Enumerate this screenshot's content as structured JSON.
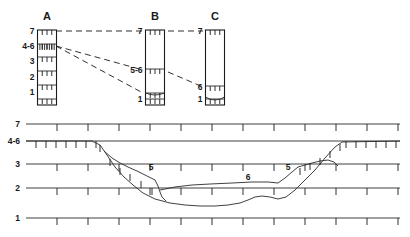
{
  "figure": {
    "background_color": "#ffffff",
    "line_color": "#1a1a1a"
  },
  "columns": {
    "headers": [
      {
        "id": "A",
        "label": "A"
      },
      {
        "id": "B",
        "label": "B"
      },
      {
        "id": "C",
        "label": "C"
      }
    ],
    "A": {
      "label": "A",
      "bed_labels": [
        "7",
        "4-6",
        "3",
        "2",
        "1"
      ]
    },
    "B": {
      "label": "B",
      "bed_labels": [
        "7",
        "5-6",
        "1"
      ]
    },
    "C": {
      "label": "C",
      "bed_labels": [
        "7",
        "6",
        "1"
      ]
    }
  },
  "correlation_lines": [
    {
      "name": "unit-7-correlation",
      "from": "A",
      "to": "C",
      "unit": "7"
    },
    {
      "name": "unit-5-6-correlation",
      "from": "A",
      "to": "B",
      "unit": "5-6"
    },
    {
      "name": "unit-6-correlation",
      "from": "A",
      "to": "C",
      "unit": "6"
    }
  ],
  "cross_section": {
    "axis_labels": [
      "7",
      "4-6",
      "3",
      "2",
      "1"
    ],
    "annotations": [
      {
        "name": "left-unit-5",
        "label": "5"
      },
      {
        "name": "valley-unit-6",
        "label": "6"
      },
      {
        "name": "right-unit-5",
        "label": "5"
      }
    ]
  },
  "chart_data": {
    "type": "line",
    "xlabel": "",
    "ylabel": "Stratigraphic unit",
    "grid": true,
    "legend_position": "none",
    "panels": [
      {
        "name": "correlation-panel",
        "type": "columns",
        "columns": [
          {
            "name": "A",
            "x_center": 47,
            "top_y": 30,
            "bottom_y": 105,
            "bed_boundaries_y": [
              30,
              44,
              57,
              71,
              85,
              99
            ],
            "bed_labels": [
              {
                "label": "7",
                "y": 31
              },
              {
                "label": "4-6",
                "y": 46
              },
              {
                "label": "3",
                "y": 61
              },
              {
                "label": "2",
                "y": 77
              },
              {
                "label": "1",
                "y": 92
              }
            ]
          },
          {
            "name": "B",
            "x_center": 155,
            "top_y": 30,
            "bottom_y": 105,
            "bed_boundaries_y": [
              30,
              69,
              93,
              99
            ],
            "bed_labels": [
              {
                "label": "7",
                "y": 31
              },
              {
                "label": "5-6",
                "y": 70
              },
              {
                "label": "1",
                "y": 99
              }
            ]
          },
          {
            "name": "C",
            "x_center": 215,
            "top_y": 30,
            "bottom_y": 105,
            "bed_boundaries_y": [
              30,
              86,
              99
            ],
            "bed_labels": [
              {
                "label": "7",
                "y": 31
              },
              {
                "label": "6",
                "y": 87
              },
              {
                "label": "1",
                "y": 99
              }
            ]
          }
        ],
        "correlations": [
          {
            "unit": "7",
            "points": [
              [
                56,
                31
              ],
              [
                143,
                31
              ]
            ]
          },
          {
            "unit": "7b",
            "points": [
              [
                168,
                31
              ],
              [
                203,
                31
              ]
            ]
          },
          {
            "unit": "5-6",
            "points": [
              [
                56,
                46
              ],
              [
                143,
                70
              ]
            ]
          },
          {
            "unit": "6a",
            "points": [
              [
                56,
                46
              ],
              [
                143,
                93
              ]
            ]
          },
          {
            "unit": "6b",
            "points": [
              [
                168,
                72
              ],
              [
                203,
                87
              ]
            ]
          }
        ]
      },
      {
        "name": "cross-section-panel",
        "type": "profile",
        "datum_lines": [
          {
            "unit": "7",
            "y": 124,
            "x_start": 26,
            "x_end": 400,
            "tick_spacing": 31,
            "tick_len": 7
          },
          {
            "unit": "4-6",
            "y": 141,
            "x_start": 26,
            "x_end": 400,
            "tick_spacing": 10,
            "tick_len": 7
          },
          {
            "unit": "3",
            "y": 164,
            "x_start": 26,
            "x_end": 400,
            "tick_spacing": 31,
            "tick_len": 7
          },
          {
            "unit": "2",
            "y": 188,
            "x_start": 26,
            "x_end": 400,
            "tick_spacing": 31,
            "tick_len": 7
          },
          {
            "unit": "1",
            "y": 218,
            "x_start": 26,
            "x_end": 400,
            "tick_spacing": 31,
            "tick_len": 7
          }
        ],
        "profiles": [
          {
            "name": "upper-erosion-surface",
            "points": [
              [
                26,
                141
              ],
              [
                92,
                141
              ],
              [
                100,
                145
              ],
              [
                107,
                155
              ],
              [
                115,
                167
              ],
              [
                124,
                177
              ],
              [
                133,
                185
              ],
              [
                143,
                193
              ],
              [
                155,
                199
              ],
              [
                170,
                203
              ],
              [
                185,
                205
              ],
              [
                200,
                206
              ],
              [
                215,
                206
              ],
              [
                228,
                205
              ],
              [
                240,
                203
              ],
              [
                248,
                200
              ],
              [
                255,
                197
              ],
              [
                262,
                196
              ],
              [
                270,
                197
              ],
              [
                278,
                199
              ],
              [
                286,
                197
              ],
              [
                295,
                190
              ],
              [
                305,
                180
              ],
              [
                315,
                170
              ],
              [
                325,
                158
              ],
              [
                335,
                147
              ],
              [
                342,
                142
              ],
              [
                400,
                141
              ]
            ]
          },
          {
            "name": "unit-5-left-bench",
            "points": [
              [
                104,
                151
              ],
              [
                112,
                158
              ],
              [
                120,
                163
              ],
              [
                128,
                167
              ],
              [
                137,
                171
              ],
              [
                147,
                176
              ],
              [
                155,
                180
              ],
              [
                158,
                186
              ],
              [
                160,
                192
              ],
              [
                162,
                197
              ],
              [
                166,
                201
              ]
            ]
          },
          {
            "name": "unit-6-valley-fill",
            "points": [
              [
                160,
                190
              ],
              [
                175,
                187
              ],
              [
                192,
                185
              ],
              [
                210,
                184
              ],
              [
                232,
                183
              ],
              [
                252,
                182
              ],
              [
                268,
                182
              ],
              [
                278,
                183
              ]
            ]
          },
          {
            "name": "unit-5-right-bench",
            "points": [
              [
                278,
                183
              ],
              [
                285,
                178
              ],
              [
                292,
                172
              ],
              [
                298,
                167
              ],
              [
                305,
                165
              ],
              [
                312,
                163
              ],
              [
                320,
                161
              ],
              [
                328,
                160
              ],
              [
                334,
                162
              ],
              [
                338,
                166
              ]
            ]
          }
        ],
        "annotations": [
          {
            "label": "5",
            "x": 151,
            "y": 170
          },
          {
            "label": "6",
            "x": 248,
            "y": 180
          },
          {
            "label": "5",
            "x": 288,
            "y": 170
          }
        ],
        "axis_labels": [
          {
            "label": "7",
            "x": 20,
            "y": 127
          },
          {
            "label": "4-6",
            "x": 20,
            "y": 144
          },
          {
            "label": "3",
            "x": 20,
            "y": 167
          },
          {
            "label": "2",
            "x": 20,
            "y": 191
          },
          {
            "label": "1",
            "x": 20,
            "y": 221
          }
        ]
      }
    ]
  }
}
